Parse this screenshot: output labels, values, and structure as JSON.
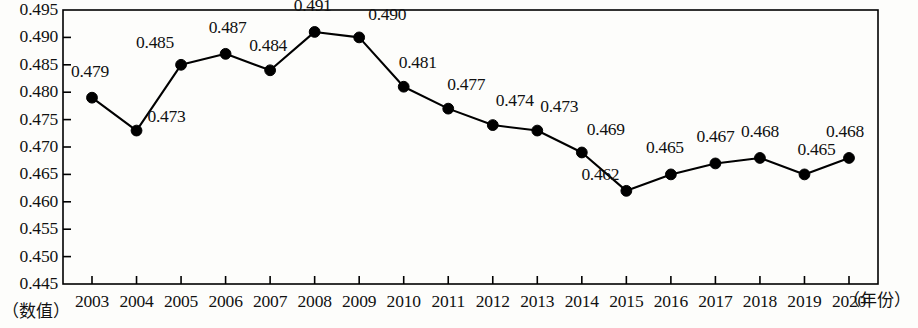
{
  "chart_data": {
    "type": "line",
    "title": "",
    "subtitle": "",
    "xlabel": "（年份）",
    "ylabel": "（数值）",
    "categories": [
      "2003",
      "2004",
      "2005",
      "2006",
      "2007",
      "2008",
      "2009",
      "2010",
      "2011",
      "2012",
      "2013",
      "2014",
      "2015",
      "2016",
      "2017",
      "2018",
      "2019",
      "2020"
    ],
    "values": [
      0.479,
      0.473,
      0.485,
      0.487,
      0.484,
      0.491,
      0.49,
      0.481,
      0.477,
      0.474,
      0.473,
      0.469,
      0.462,
      0.465,
      0.467,
      0.468,
      0.465,
      0.468
    ],
    "point_labels": [
      "0.479",
      "0.473",
      "0.485",
      "0.487",
      "0.484",
      "0.491",
      "0.490",
      "0.481",
      "0.477",
      "0.474",
      "0.473",
      "0.469",
      "0.462",
      "0.465",
      "0.467",
      "0.468",
      "0.465",
      "0.468"
    ],
    "ylim": [
      0.445,
      0.495
    ],
    "ytick_labels": [
      "0.495",
      "0.490",
      "0.485",
      "0.480",
      "0.475",
      "0.470",
      "0.465",
      "0.460",
      "0.455",
      "0.450",
      "0.445"
    ],
    "ytick_values": [
      0.495,
      0.49,
      0.485,
      0.48,
      0.475,
      0.47,
      0.465,
      0.46,
      0.455,
      0.45,
      0.445
    ],
    "grid": false,
    "legend": "none",
    "series_color": "#000000",
    "marker": "circle",
    "marker_color": "#000000",
    "frame_color": "#000000",
    "background_color": "#fdfdfb",
    "label_offsets": [
      {
        "dx": -2,
        "dy": -26
      },
      {
        "dx": 30,
        "dy": -14
      },
      {
        "dx": -26,
        "dy": -22
      },
      {
        "dx": 2,
        "dy": -26
      },
      {
        "dx": -2,
        "dy": -24
      },
      {
        "dx": -2,
        "dy": -26
      },
      {
        "dx": 28,
        "dy": -22
      },
      {
        "dx": 14,
        "dy": -24
      },
      {
        "dx": 18,
        "dy": -24
      },
      {
        "dx": 22,
        "dy": -24
      },
      {
        "dx": 22,
        "dy": -24
      },
      {
        "dx": 24,
        "dy": -22
      },
      {
        "dx": -26,
        "dy": -16
      },
      {
        "dx": -6,
        "dy": -26
      },
      {
        "dx": 0,
        "dy": -26
      },
      {
        "dx": 0,
        "dy": -26
      },
      {
        "dx": 12,
        "dy": -24
      },
      {
        "dx": -4,
        "dy": -26
      }
    ]
  }
}
